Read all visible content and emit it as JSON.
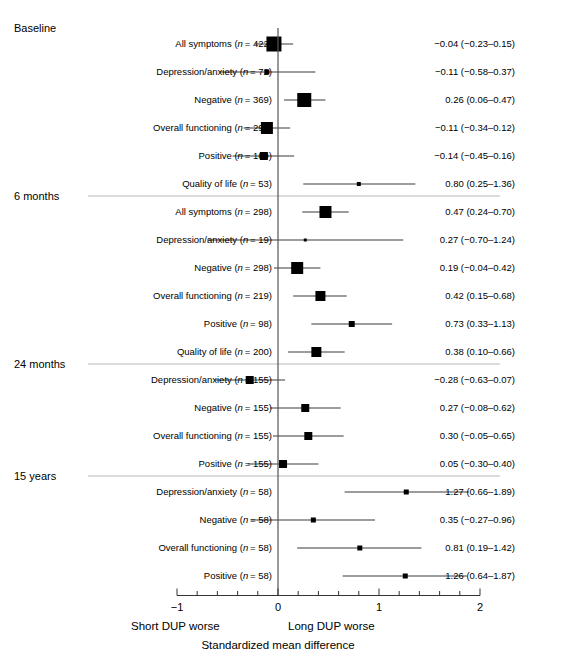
{
  "figure": {
    "x_axis_title": "Standardized mean difference",
    "left_direction_label": "Short DUP worse",
    "right_direction_label": "Long  DUP worse",
    "tick_labels": [
      "-1",
      "0",
      "1",
      "2"
    ],
    "tick_values": [
      -1,
      0,
      1,
      2
    ],
    "xlim": [
      -1,
      2
    ],
    "minor_tick_step": 0.2,
    "null_line_value": 0,
    "marker_color": "#000000",
    "line_color": "#3a3a3a",
    "rule_color": "#b9b9b9"
  },
  "chart_data": {
    "type": "forest",
    "title": "",
    "xlabel": "Standardized mean difference",
    "ylabel": "",
    "xlim": [
      -1,
      2
    ],
    "ticks": [
      -1,
      0,
      1,
      2
    ],
    "minor_tick_step": 0.2,
    "reference_line": 0,
    "left_label": "Short DUP worse",
    "right_label": "Long  DUP worse",
    "groups": [
      {
        "name": "Baseline",
        "rows": [
          {
            "label": "All symptoms (n = 422)",
            "outcome": "All symptoms",
            "n": 422,
            "estimate": -0.04,
            "ci_low": -0.23,
            "ci_high": 0.15,
            "value_text": "−0.04 (−0.23–0.15)",
            "box": 15
          },
          {
            "label": "Depression/anxiety (n = 72)",
            "outcome": "Depression/anxiety",
            "n": 72,
            "estimate": -0.11,
            "ci_low": -0.58,
            "ci_high": 0.37,
            "value_text": "−0.11 (−0.58–0.37)",
            "box": 5
          },
          {
            "label": "Negative (n = 369)",
            "outcome": "Negative",
            "n": 369,
            "estimate": 0.26,
            "ci_low": 0.06,
            "ci_high": 0.47,
            "value_text": "0.26 (0.06–0.47)",
            "box": 14
          },
          {
            "label": "Overall functioning (n = 290)",
            "outcome": "Overall functioning",
            "n": 290,
            "estimate": -0.11,
            "ci_low": -0.34,
            "ci_high": 0.12,
            "value_text": "−0.11 (−0.34–0.12)",
            "box": 12
          },
          {
            "label": "Positive (n = 169)",
            "outcome": "Positive",
            "n": 169,
            "estimate": -0.14,
            "ci_low": -0.45,
            "ci_high": 0.16,
            "value_text": "−0.14 (−0.45–0.16)",
            "box": 8
          },
          {
            "label": "Quality of life (n = 53)",
            "outcome": "Quality of life",
            "n": 53,
            "estimate": 0.8,
            "ci_low": 0.25,
            "ci_high": 1.36,
            "value_text": "0.80 (0.25–1.36)",
            "box": 4
          }
        ]
      },
      {
        "name": "6 months",
        "rows": [
          {
            "label": "All symptoms (n = 298)",
            "outcome": "All symptoms",
            "n": 298,
            "estimate": 0.47,
            "ci_low": 0.24,
            "ci_high": 0.7,
            "value_text": "0.47 (0.24–0.70)",
            "box": 12
          },
          {
            "label": "Depression/anxiety (n = 19)",
            "outcome": "Depression/anxiety",
            "n": 19,
            "estimate": 0.27,
            "ci_low": -0.7,
            "ci_high": 1.24,
            "value_text": "0.27 (−0.70–1.24)",
            "box": 3
          },
          {
            "label": "Negative (n = 298)",
            "outcome": "Negative",
            "n": 298,
            "estimate": 0.19,
            "ci_low": -0.04,
            "ci_high": 0.42,
            "value_text": "0.19 (−0.04–0.42)",
            "box": 12
          },
          {
            "label": "Overall functioning (n = 219)",
            "outcome": "Overall functioning",
            "n": 219,
            "estimate": 0.42,
            "ci_low": 0.15,
            "ci_high": 0.68,
            "value_text": "0.42 (0.15–0.68)",
            "box": 10
          },
          {
            "label": "Positive (n = 98)",
            "outcome": "Positive",
            "n": 98,
            "estimate": 0.73,
            "ci_low": 0.33,
            "ci_high": 1.13,
            "value_text": "0.73 (0.33–1.13)",
            "box": 6
          },
          {
            "label": "Quality of life (n = 200)",
            "outcome": "Quality of life",
            "n": 200,
            "estimate": 0.38,
            "ci_low": 0.1,
            "ci_high": 0.66,
            "value_text": "0.38 (0.10–0.66)",
            "box": 10
          }
        ]
      },
      {
        "name": "24 months",
        "rows": [
          {
            "label": "Depression/anxiety (n = 155)",
            "outcome": "Depression/anxiety",
            "n": 155,
            "estimate": -0.28,
            "ci_low": -0.63,
            "ci_high": 0.07,
            "value_text": "−0.28 (−0.63–0.07)",
            "box": 8
          },
          {
            "label": "Negative (n = 155)",
            "outcome": "Negative",
            "n": 155,
            "estimate": 0.27,
            "ci_low": -0.08,
            "ci_high": 0.62,
            "value_text": "0.27 (−0.08–0.62)",
            "box": 8
          },
          {
            "label": "Overall functioning (n = 155)",
            "outcome": "Overall functioning",
            "n": 155,
            "estimate": 0.3,
            "ci_low": -0.05,
            "ci_high": 0.65,
            "value_text": "0.30 (−0.05–0.65)",
            "box": 8
          },
          {
            "label": "Positive (n = 155)",
            "outcome": "Positive",
            "n": 155,
            "estimate": 0.05,
            "ci_low": -0.3,
            "ci_high": 0.4,
            "value_text": "0.05 (−0.30–0.40)",
            "box": 8
          }
        ]
      },
      {
        "name": "15 years",
        "rows": [
          {
            "label": "Depression/anxiety (n = 58)",
            "outcome": "Depression/anxiety",
            "n": 58,
            "estimate": 1.27,
            "ci_low": 0.66,
            "ci_high": 1.89,
            "value_text": "1.27 (0.66–1.89)",
            "box": 5
          },
          {
            "label": "Negative (n = 58)",
            "outcome": "Negative",
            "n": 58,
            "estimate": 0.35,
            "ci_low": -0.27,
            "ci_high": 0.96,
            "value_text": "0.35 (−0.27–0.96)",
            "box": 5
          },
          {
            "label": "Overall functioning (n = 58)",
            "outcome": "Overall functioning",
            "n": 58,
            "estimate": 0.81,
            "ci_low": 0.19,
            "ci_high": 1.42,
            "value_text": "0.81 (0.19–1.42)",
            "box": 5
          },
          {
            "label": "Positive (n = 58)",
            "outcome": "Positive",
            "n": 58,
            "estimate": 1.26,
            "ci_low": 0.64,
            "ci_high": 1.87,
            "value_text": "1.26 (0.64–1.87)",
            "box": 5
          }
        ]
      }
    ]
  }
}
